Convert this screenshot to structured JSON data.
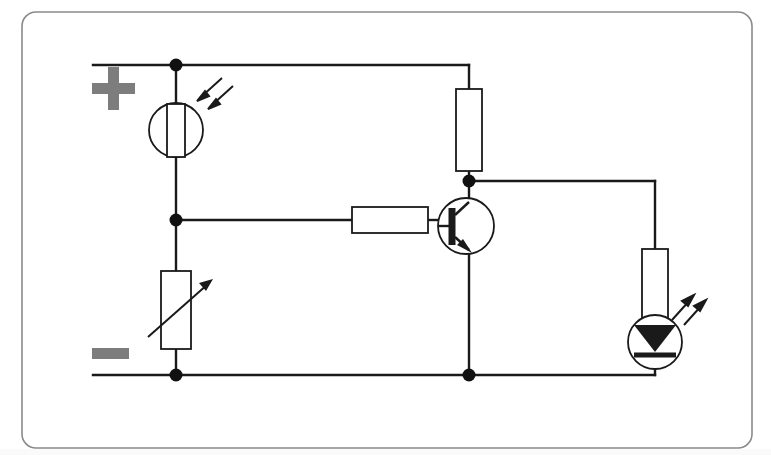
{
  "figure": {
    "kind": "circuit-schematic",
    "title": "Light dependent resistor controlled LED circuit",
    "frame": {
      "stroke_color": "#8a8a8a",
      "corner_radius": 14,
      "x": 22,
      "y": 12,
      "width": 730,
      "height": 436
    },
    "background_color": "#ffffff",
    "wire_color": "#1a1a1a",
    "component_fill": "#ffffff",
    "polarity_marker_color": "#7d7d7d"
  },
  "rails": {
    "positive": {
      "label": "+",
      "icon": "plus-sign",
      "y": 65,
      "x_start": 93,
      "x_end": 469
    },
    "negative": {
      "label": "−",
      "icon": "minus-sign",
      "y": 375,
      "x_start": 93,
      "x_end": 655
    }
  },
  "components": [
    {
      "id": "ldr",
      "name": "light-dependent-resistor",
      "symbol": "resistor-in-circle-with-incoming-light-arrows",
      "label": "LDR",
      "x": 176,
      "y": 130,
      "circle_radius": 27,
      "body_width": 18,
      "body_height": 52,
      "arrows": "incoming",
      "arrow_count": 2
    },
    {
      "id": "variable-resistor",
      "name": "variable-resistor",
      "symbol": "rectangle-with-diagonal-arrow",
      "label": "VR",
      "x": 176,
      "y": 310,
      "body_width": 30,
      "body_height": 78
    },
    {
      "id": "base-resistor",
      "name": "base-resistor",
      "symbol": "rectangle-horizontal",
      "label": "Rb",
      "x": 390,
      "y": 220,
      "body_width": 76,
      "body_height": 26
    },
    {
      "id": "collector-resistor",
      "name": "collector-resistor",
      "symbol": "rectangle-vertical",
      "label": "Rc",
      "x": 469,
      "y": 130,
      "body_width": 26,
      "body_height": 82
    },
    {
      "id": "transistor",
      "name": "npn-transistor",
      "symbol": "npn-bipolar-junction-transistor",
      "label": "NPN",
      "x": 466,
      "y": 226,
      "circle_radius": 28,
      "terminals": {
        "base": "left",
        "collector": "top",
        "emitter": "bottom"
      }
    },
    {
      "id": "led-resistor",
      "name": "led-series-resistor",
      "symbol": "rectangle-vertical",
      "label": "Rled",
      "x": 655,
      "y": 285,
      "body_width": 26,
      "body_height": 72
    },
    {
      "id": "led",
      "name": "light-emitting-diode",
      "symbol": "diode-in-circle-with-outgoing-light-arrows",
      "label": "LED",
      "x": 655,
      "y": 342,
      "circle_radius": 27,
      "arrows": "outgoing",
      "arrow_count": 2
    }
  ],
  "junctions": [
    {
      "name": "positive-rail-ldr-node",
      "x": 176,
      "y": 65,
      "radius": 6
    },
    {
      "name": "divider-midpoint-node",
      "x": 176,
      "y": 220,
      "radius": 6
    },
    {
      "name": "negative-rail-left-node",
      "x": 176,
      "y": 375,
      "radius": 6
    },
    {
      "name": "collector-node",
      "x": 469,
      "y": 181,
      "radius": 6
    },
    {
      "name": "emitter-ground-node",
      "x": 469,
      "y": 375,
      "radius": 6
    }
  ],
  "wires": [
    {
      "name": "positive-rail",
      "points": "93,65 469,65"
    },
    {
      "name": "ldr-top-lead",
      "points": "176,65 176,104"
    },
    {
      "name": "ldr-bottom-lead",
      "points": "176,157 176,271"
    },
    {
      "name": "divider-to-base-resistor",
      "points": "176,220 352,220"
    },
    {
      "name": "variable-resistor-bottom-lead",
      "points": "176,349 176,375"
    },
    {
      "name": "base-resistor-to-transistor",
      "points": "428,220 438,220"
    },
    {
      "name": "top-rail-to-collector-resistor",
      "points": "469,65 469,89"
    },
    {
      "name": "collector-resistor-to-transistor",
      "points": "469,171 469,200"
    },
    {
      "name": "collector-node-to-led-branch",
      "points": "469,181 655,181"
    },
    {
      "name": "led-branch-down-to-resistor",
      "points": "655,181 655,249"
    },
    {
      "name": "led-resistor-to-led",
      "points": "655,321 655,321"
    },
    {
      "name": "emitter-to-negative-rail",
      "points": "469,252 469,375"
    },
    {
      "name": "negative-rail",
      "points": "93,375 655,375"
    },
    {
      "name": "led-cathode-to-negative-rail",
      "points": "655,369 655,375"
    }
  ]
}
